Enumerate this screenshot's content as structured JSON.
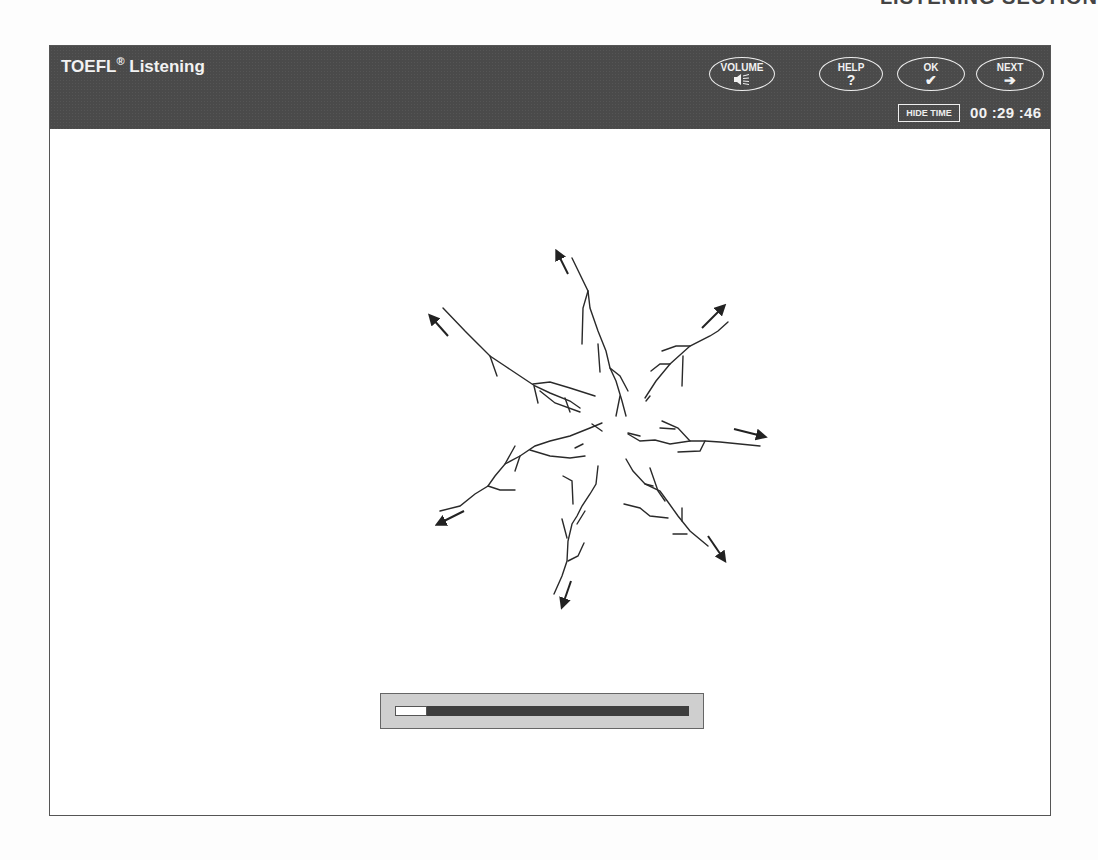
{
  "page_header_remnant": "LISTENING SECTION",
  "app": {
    "title": "TOEFL",
    "title_mark": "®",
    "title_suffix": " Listening"
  },
  "toolbar": {
    "buttons": [
      {
        "id": "volume",
        "label": "VOLUME",
        "icon": "speaker-icon",
        "glyph": "◀≡"
      },
      {
        "id": "help",
        "label": "HELP",
        "icon": "question-icon",
        "glyph": "?"
      },
      {
        "id": "ok",
        "label": "OK",
        "icon": "checkmark-icon",
        "glyph": "✔"
      },
      {
        "id": "next",
        "label": "NEXT",
        "icon": "arrow-right-icon",
        "glyph": "➔"
      }
    ],
    "hide_time_label": "HIDE TIME",
    "timer": "00 :29 :46"
  },
  "content": {
    "image_description": "Radial branching cracks spreading outward from a central point with arrows indicating outward direction",
    "arrow_count": 8
  },
  "progress": {
    "percent": 11
  },
  "colors": {
    "titlebar": "#4a4a4a",
    "title_text": "#f2f2f2",
    "progress_track": "#3e3e3e",
    "progress_bg": "#cfcfcf"
  }
}
